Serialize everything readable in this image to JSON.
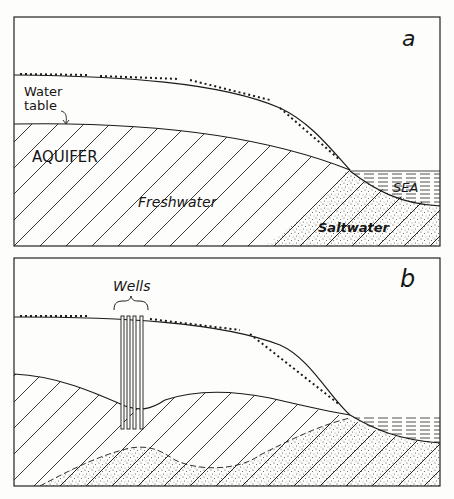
{
  "panels": [
    {
      "id": "a",
      "letter": "a",
      "labels": {
        "water_table": [
          "Water",
          "table"
        ],
        "aquifer": "AQUIFER",
        "freshwater": "Freshwater",
        "sea": "SEA",
        "saltwater": "Saltwater"
      }
    },
    {
      "id": "b",
      "letter": "b",
      "labels": {
        "wells": "Wells"
      }
    }
  ],
  "colors": {
    "ink": "#1a1a1a",
    "paper": "#fdfdfc",
    "stipple": "#444444"
  }
}
